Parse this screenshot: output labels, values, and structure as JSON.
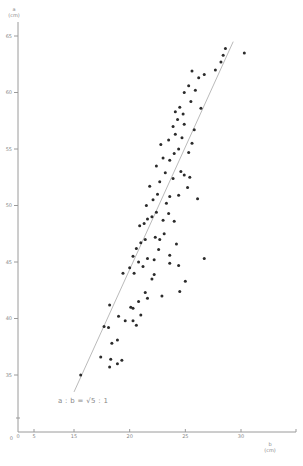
{
  "chart_data": {
    "type": "scatter",
    "title": "",
    "xlabel": "b (cm)",
    "ylabel": "a (cm)",
    "x_axis": {
      "label_var": "b",
      "label_unit": "(cm)",
      "ticks": [
        0,
        5,
        15,
        20,
        25,
        30
      ],
      "tick_labels": [
        "0",
        "5",
        "15",
        "20",
        "25",
        "30"
      ],
      "axis_break": true
    },
    "y_axis": {
      "label_var": "a",
      "label_unit": "(cm)",
      "ticks": [
        0,
        35,
        40,
        45,
        50,
        55,
        60,
        65
      ],
      "tick_labels": [
        "0",
        "35",
        "40",
        "45",
        "50",
        "55",
        "60",
        "65"
      ],
      "axis_break": true
    },
    "xlim": [
      0,
      33
    ],
    "ylim": [
      0,
      67
    ],
    "grid": false,
    "legend": null,
    "annotation": "a : b = √5 : 1",
    "reference_line": {
      "description": "a = √5 · b",
      "from": [
        15,
        33.5
      ],
      "to": [
        29.3,
        64.5
      ]
    },
    "points": [
      [
        15.6,
        35.0
      ],
      [
        17.4,
        36.6
      ],
      [
        18.2,
        35.7
      ],
      [
        18.3,
        36.4
      ],
      [
        18.9,
        36.0
      ],
      [
        19.3,
        36.3
      ],
      [
        17.7,
        39.3
      ],
      [
        18.1,
        39.2
      ],
      [
        18.9,
        38.1
      ],
      [
        18.4,
        37.8
      ],
      [
        18.2,
        41.2
      ],
      [
        19.0,
        40.2
      ],
      [
        19.6,
        39.8
      ],
      [
        20.3,
        39.8
      ],
      [
        20.6,
        39.4
      ],
      [
        21.0,
        40.3
      ],
      [
        20.1,
        41.0
      ],
      [
        20.8,
        41.5
      ],
      [
        21.4,
        42.3
      ],
      [
        22.0,
        43.5
      ],
      [
        19.4,
        44.0
      ],
      [
        20.0,
        44.5
      ],
      [
        20.4,
        44.0
      ],
      [
        20.8,
        45.0
      ],
      [
        21.2,
        44.6
      ],
      [
        21.6,
        45.3
      ],
      [
        22.2,
        45.2
      ],
      [
        22.6,
        46.1
      ],
      [
        23.6,
        45.6
      ],
      [
        24.4,
        44.7
      ],
      [
        20.3,
        45.5
      ],
      [
        20.6,
        46.2
      ],
      [
        21.0,
        46.7
      ],
      [
        21.4,
        47.0
      ],
      [
        22.3,
        47.2
      ],
      [
        22.7,
        47.0
      ],
      [
        23.1,
        47.5
      ],
      [
        20.9,
        48.2
      ],
      [
        21.3,
        48.4
      ],
      [
        21.6,
        48.8
      ],
      [
        22.0,
        49.0
      ],
      [
        22.4,
        49.4
      ],
      [
        23.0,
        48.7
      ],
      [
        23.5,
        49.3
      ],
      [
        24.0,
        48.6
      ],
      [
        21.5,
        50.0
      ],
      [
        22.1,
        50.5
      ],
      [
        22.5,
        51.0
      ],
      [
        23.3,
        50.2
      ],
      [
        23.6,
        50.8
      ],
      [
        24.4,
        50.9
      ],
      [
        25.2,
        51.6
      ],
      [
        26.1,
        50.6
      ],
      [
        21.8,
        51.7
      ],
      [
        22.7,
        52.1
      ],
      [
        23.2,
        52.9
      ],
      [
        23.9,
        52.4
      ],
      [
        24.6,
        53.0
      ],
      [
        24.9,
        52.7
      ],
      [
        25.4,
        52.5
      ],
      [
        22.4,
        53.5
      ],
      [
        23.0,
        54.2
      ],
      [
        23.6,
        54.0
      ],
      [
        24.0,
        54.6
      ],
      [
        24.4,
        55.0
      ],
      [
        25.3,
        54.7
      ],
      [
        22.8,
        55.4
      ],
      [
        23.5,
        55.8
      ],
      [
        24.1,
        56.3
      ],
      [
        24.7,
        56.0
      ],
      [
        25.6,
        55.5
      ],
      [
        23.9,
        57.0
      ],
      [
        24.3,
        57.6
      ],
      [
        24.9,
        57.2
      ],
      [
        25.8,
        56.7
      ],
      [
        24.1,
        58.3
      ],
      [
        24.5,
        58.7
      ],
      [
        24.8,
        58.1
      ],
      [
        25.5,
        59.2
      ],
      [
        26.4,
        58.6
      ],
      [
        24.9,
        60.0
      ],
      [
        25.3,
        60.6
      ],
      [
        25.9,
        60.2
      ],
      [
        26.2,
        61.3
      ],
      [
        25.6,
        61.9
      ],
      [
        26.7,
        61.6
      ],
      [
        27.7,
        62.0
      ],
      [
        28.2,
        62.7
      ],
      [
        28.4,
        63.3
      ],
      [
        28.6,
        63.9
      ],
      [
        30.3,
        63.5
      ],
      [
        25.0,
        43.3
      ],
      [
        24.5,
        42.4
      ],
      [
        20.3,
        40.9
      ],
      [
        26.7,
        45.3
      ],
      [
        23.6,
        44.9
      ],
      [
        24.2,
        46.6
      ],
      [
        22.2,
        43.9
      ],
      [
        21.6,
        41.8
      ],
      [
        22.9,
        42.0
      ]
    ]
  }
}
